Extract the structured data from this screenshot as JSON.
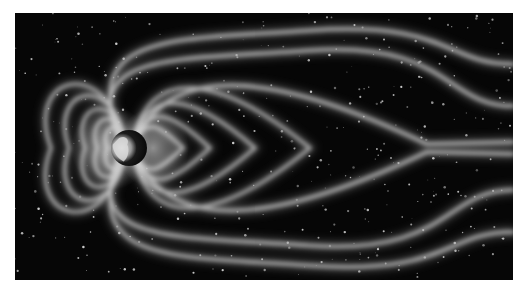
{
  "image": {
    "alt": "Illustration of Earth's magnetosphere: glowing magnetic field lines around Earth compressed on the dayside and stretched into a long magnetotail, set against a starfield",
    "colors": {
      "background": "#ffffff",
      "space": "#060606",
      "field_line": "#bdbdbd",
      "field_glow": "#8a8a8a",
      "earth_light": "#e6e6e6",
      "earth_dark": "#0a0a0a",
      "star": "#d8d8d8"
    },
    "frame": {
      "x": 15,
      "y": 13,
      "width": 498,
      "height": 267
    },
    "earth": {
      "cx": 114,
      "cy": 135,
      "r": 18
    },
    "dayside_loops": [
      {
        "rx": 78,
        "ry": 76,
        "offset": 0
      },
      {
        "rx": 60,
        "ry": 62,
        "offset": 0
      },
      {
        "rx": 44,
        "ry": 46,
        "offset": 0
      },
      {
        "rx": 32,
        "ry": 34,
        "offset": 0
      },
      {
        "rx": 22,
        "ry": 24,
        "offset": 0
      }
    ],
    "nightside_closed_loops": [
      {
        "tip_x": 295,
        "half_height": 70
      },
      {
        "tip_x": 240,
        "half_height": 52
      },
      {
        "tip_x": 195,
        "half_height": 36
      },
      {
        "tip_x": 168,
        "half_height": 24
      }
    ],
    "tail_lines": [
      {
        "start_y_offset": -94,
        "end_y_offset": -80
      },
      {
        "start_y_offset": -78,
        "end_y_offset": -40
      },
      {
        "start_y_offset": 78,
        "end_y_offset": 40
      },
      {
        "start_y_offset": 94,
        "end_y_offset": 80
      },
      {
        "start_y_offset": -62,
        "end_y_offset": 0,
        "pinch_x": 412
      },
      {
        "start_y_offset": 62,
        "end_y_offset": 0,
        "pinch_x": 412
      }
    ],
    "stars": {
      "count": 420,
      "seed": 7
    }
  }
}
